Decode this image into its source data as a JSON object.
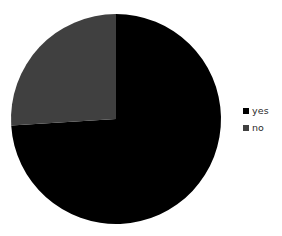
{
  "chart_data": {
    "type": "pie",
    "title": "",
    "categories": [
      "yes",
      "no"
    ],
    "values": [
      74,
      26
    ],
    "units": "percent",
    "colors": [
      "#000000",
      "#404040"
    ],
    "start_angle_deg": 0,
    "direction": "clockwise",
    "legend_position": "right",
    "grid": false,
    "slices": [
      {
        "label": "yes",
        "value": 74,
        "color": "#000000",
        "start_deg": 0,
        "sweep_deg": 266.4
      },
      {
        "label": "no",
        "value": 26,
        "color": "#404040",
        "start_deg": 266.4,
        "sweep_deg": 93.6
      }
    ]
  },
  "legend": {
    "items": [
      {
        "label": "yes",
        "color": "#000000",
        "marker": "square-marker"
      },
      {
        "label": "no",
        "color": "#404040",
        "marker": "square-marker"
      }
    ]
  },
  "canvas": {
    "background": "#ffffff",
    "width": 282,
    "height": 236
  },
  "pie_geometry": {
    "center_x": 116,
    "center_y": 119,
    "radius": 105
  }
}
